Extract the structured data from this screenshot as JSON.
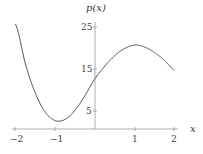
{
  "chart_data": {
    "type": "line",
    "title": "",
    "xlabel": "x",
    "ylabel": "p(x)",
    "xlim": [
      -2,
      2
    ],
    "ylim": [
      0,
      26
    ],
    "x_ticks": [
      "-2",
      "-1",
      "1",
      "2"
    ],
    "y_ticks": [
      "5",
      "15",
      "25"
    ],
    "grid": false,
    "series": [
      {
        "name": "p(x)",
        "x": [
          -2,
          -1.75,
          -1.5,
          -1.25,
          -1,
          -0.75,
          -0.5,
          -0.25,
          0,
          0.25,
          0.5,
          0.75,
          1,
          1.25,
          1.5,
          1.75,
          2
        ],
        "values": [
          25,
          15.5,
          8.5,
          4,
          2,
          2.3,
          4.5,
          8,
          12,
          15,
          17.5,
          19.2,
          20,
          19.5,
          18.2,
          16.3,
          14
        ]
      }
    ]
  },
  "labels": {
    "y_axis": "p(x)",
    "x_axis": "x",
    "y25": "25",
    "y15": "15",
    "y5": "5",
    "xm2": "−2",
    "xm1": "−1",
    "x1": "1",
    "x2": "2"
  }
}
